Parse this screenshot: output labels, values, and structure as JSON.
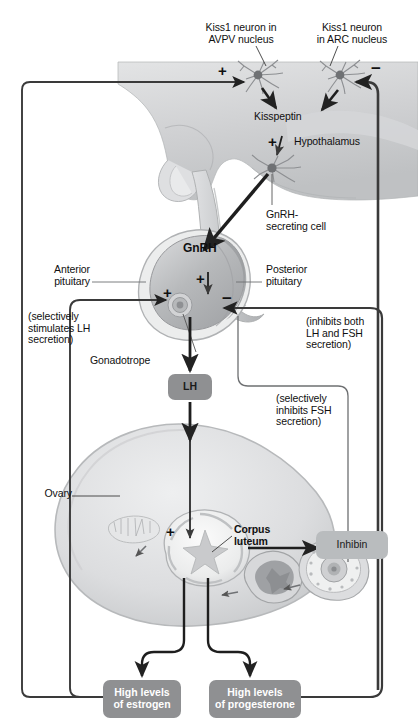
{
  "figure": {
    "accent_gray": "#8f9092",
    "inhibin_gray": "#b9bcbe",
    "line_color": "#3a3a3a",
    "tissue_gray": "#c8c9cb"
  },
  "labels": {
    "kiss1_avpv": "Kiss1 neuron in\nAVPV nucleus",
    "kiss1_arc": "Kiss1 neuron\nin ARC nucleus",
    "kisspeptin": "Kisspeptin",
    "hypothalamus": "Hypothalamus",
    "gnrh_secreting_cell": "GnRH-\nsecreting cell",
    "gnrh": "GnRH",
    "anterior_pituitary": "Anterior\npituitary",
    "posterior_pituitary": "Posterior\npituitary",
    "gonadotrope": "Gonadotrope",
    "ovary": "Ovary",
    "corpus_luteum": "Corpus\nluteum"
  },
  "hormone_boxes": {
    "lh": "LH",
    "inhibin": "Inhibin",
    "estrogen": "High levels\nof estrogen",
    "progesterone": "High levels\nof progesterone"
  },
  "annotations": {
    "selectively_stimulates_lh": "(selectively\nstimulates LH\nsecretion)",
    "inhibits_both": "(inhibits both\nLH and FSH\nsecretion)",
    "selectively_inhibits_fsh": "(selectively\ninhibits FSH\nsecretion)"
  },
  "signs": {
    "avpv_plus": "+",
    "arc_minus": "−",
    "kisspeptin_plus": "+",
    "gnrh_plus": "+",
    "gonadotrope_plus": "+",
    "gonadotrope_minus": "−",
    "corpus_luteum_plus": "+"
  }
}
